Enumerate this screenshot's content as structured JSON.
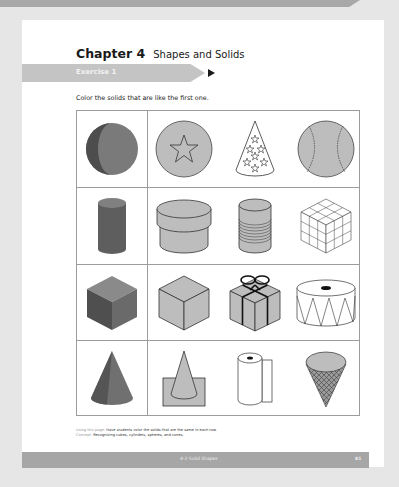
{
  "banner": {
    "text": "p g"
  },
  "chapter": {
    "number": "Chapter 4",
    "title": "Shapes and Solids"
  },
  "exercise": {
    "label": "Exercise 1"
  },
  "instruction": "Color the solids that are like the first one.",
  "rows": [
    {
      "reference": "sphere",
      "options": [
        "ball-with-star",
        "party-hat-cone",
        "baseball"
      ]
    },
    {
      "reference": "cylinder",
      "options": [
        "round-box",
        "tin-can",
        "rubiks-cube"
      ]
    },
    {
      "reference": "cube",
      "options": [
        "box-cube",
        "gift-box",
        "drum"
      ]
    },
    {
      "reference": "cone",
      "options": [
        "cone-on-base",
        "paper-towel-roll",
        "ice-cream-cone"
      ]
    }
  ],
  "footnote": {
    "line1_lead": "Using this page:",
    "line1_text": "Have students color the solids that are the same in each row.",
    "line2_lead": "Concept:",
    "line2_text": "Recognizing cubes, cylinders, spheres, and cones."
  },
  "footer": {
    "section": "4-2 Solid Shapes",
    "page_number": "81"
  },
  "colors": {
    "reference_fill": "#6f6f6f",
    "option_fill": "#bdbdbd",
    "outline": "#333333",
    "grid_line": "#9c9c9c"
  }
}
